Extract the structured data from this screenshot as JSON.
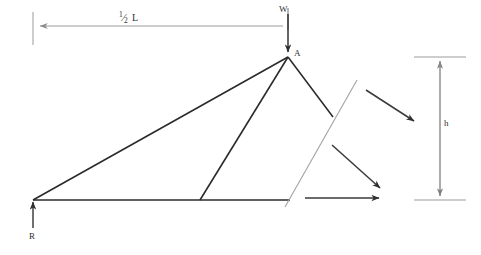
{
  "figure": {
    "labels": {
      "span_half": {
        "numerator": "1",
        "slash": "⁄",
        "denominator": "2",
        "symbol": "L"
      },
      "load": "W",
      "apex": "A",
      "reaction": "R",
      "height": "h"
    },
    "colors": {
      "member": "#2b2b2b",
      "dimension": "#8a8a8a",
      "cut_line": "#9a9a9a",
      "force_arrow": "#3a3a3a",
      "background": "#ffffff"
    },
    "geometry": {
      "left_support": [
        33,
        200
      ],
      "apex": [
        288,
        57
      ],
      "bottom_chord_end": [
        290,
        200
      ],
      "web_base": [
        200,
        200
      ],
      "right_member_end": [
        333,
        117
      ],
      "dimension_top_y": 26,
      "height_dim_x": 440,
      "height_top_y": 57,
      "height_bottom_y": 200
    },
    "force_arrows": [
      {
        "name": "upper-right-force",
        "from": [
          366,
          90
        ],
        "to": [
          416,
          123
        ]
      },
      {
        "name": "lower-right-force",
        "from": [
          332,
          145
        ],
        "to": [
          382,
          190
        ]
      },
      {
        "name": "horizontal-force",
        "from": [
          305,
          198
        ],
        "to": [
          381,
          198
        ]
      }
    ]
  }
}
